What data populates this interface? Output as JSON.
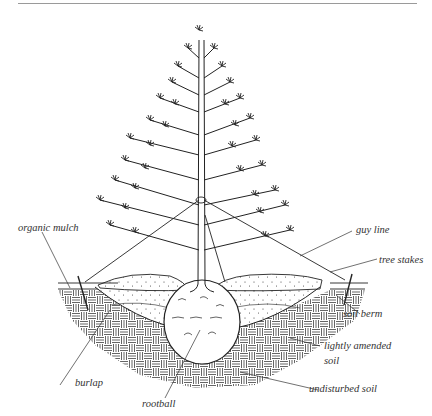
{
  "diagram": {
    "labels": {
      "organic_mulch": "organic mulch",
      "guy_line": "guy line",
      "tree_stakes": "tree stakes",
      "soil_berm": "soil berm",
      "lightly_amended_soil_1": "lightly amended",
      "lightly_amended_soil_2": "soil",
      "undisturbed_soil": "undisturbed soil",
      "burlap": "burlap",
      "rootball": "rootball"
    },
    "colors": {
      "ink": "#222222",
      "rule": "#9a9a9a",
      "background": "#ffffff"
    }
  }
}
